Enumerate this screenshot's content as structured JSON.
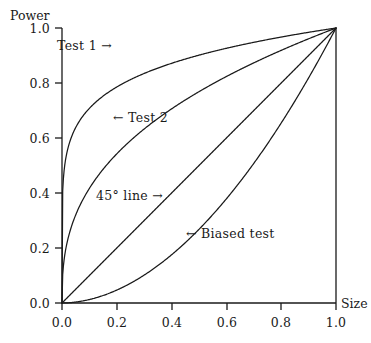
{
  "figure": {
    "background": "#ffffff",
    "ink_color": "#1a1a1a"
  },
  "axes": {
    "y_title": "Power",
    "x_title": "Size",
    "x_ticks": [
      "0.0",
      "0.2",
      "0.4",
      "0.6",
      "0.8",
      "1.0"
    ],
    "y_ticks": [
      "0.0",
      "0.2",
      "0.4",
      "0.6",
      "0.8",
      "1.0"
    ]
  },
  "annotations": [
    {
      "id": "test1",
      "text": "Test 1 →"
    },
    {
      "id": "test2",
      "text": "← Test 2"
    },
    {
      "id": "line45",
      "text": "45° line →"
    },
    {
      "id": "biased",
      "text": "← Biased test"
    }
  ],
  "chart_data": {
    "type": "line",
    "title": "",
    "xlabel": "Size",
    "ylabel": "Power",
    "xlim": [
      0.0,
      1.0
    ],
    "ylim": [
      0.0,
      1.0
    ],
    "grid": false,
    "legend": "inline-annotations",
    "xticks": [
      0.0,
      0.2,
      0.4,
      0.6,
      0.8,
      1.0
    ],
    "yticks": [
      0.0,
      0.2,
      0.4,
      0.6,
      0.8,
      1.0
    ],
    "x": [
      0.0,
      0.02,
      0.05,
      0.1,
      0.15,
      0.2,
      0.3,
      0.4,
      0.5,
      0.6,
      0.7,
      0.8,
      0.9,
      1.0
    ],
    "series": [
      {
        "name": "Test 1",
        "curve": "y = x^0.15",
        "values": [
          0.0,
          0.56,
          0.64,
          0.71,
          0.75,
          0.78,
          0.83,
          0.87,
          0.9,
          0.93,
          0.95,
          0.97,
          0.98,
          1.0
        ]
      },
      {
        "name": "Test 2",
        "curve": "y = x^0.38",
        "values": [
          0.0,
          0.22,
          0.31,
          0.41,
          0.47,
          0.53,
          0.62,
          0.7,
          0.77,
          0.83,
          0.88,
          0.92,
          0.96,
          1.0
        ]
      },
      {
        "name": "45° line",
        "curve": "y = x",
        "values": [
          0.0,
          0.02,
          0.05,
          0.1,
          0.15,
          0.2,
          0.3,
          0.4,
          0.5,
          0.6,
          0.7,
          0.8,
          0.9,
          1.0
        ]
      },
      {
        "name": "Biased test",
        "curve": "y = x^1.9",
        "values": [
          0.0,
          0.0006,
          0.0034,
          0.0126,
          0.027,
          0.047,
          0.1,
          0.17,
          0.27,
          0.38,
          0.51,
          0.66,
          0.82,
          1.0
        ]
      }
    ]
  }
}
